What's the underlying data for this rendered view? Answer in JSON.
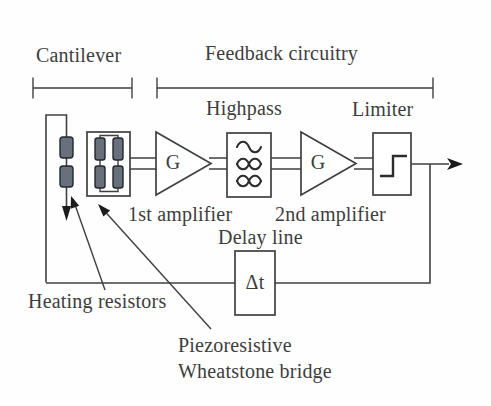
{
  "diagram": {
    "section_labels": {
      "cantilever": "Cantilever",
      "feedback": "Feedback circuitry"
    },
    "blocks": {
      "highpass_label": "Highpass",
      "limiter_label": "Limiter",
      "first_gain": "G",
      "second_gain": "G",
      "first_amplifier_label": "1st amplifier",
      "second_amplifier_label": "2nd amplifier",
      "delay_line_label": "Delay line",
      "delay_symbol": "Δt"
    },
    "annotations": {
      "heating_resistors": "Heating resistors",
      "piezo_line1": "Piezoresistive",
      "piezo_line2": "Wheatstone bridge"
    },
    "colors": {
      "line": "#404040",
      "text": "#3d3d3d",
      "resistor_fill": "#68707c",
      "background": "#fefefe"
    }
  }
}
